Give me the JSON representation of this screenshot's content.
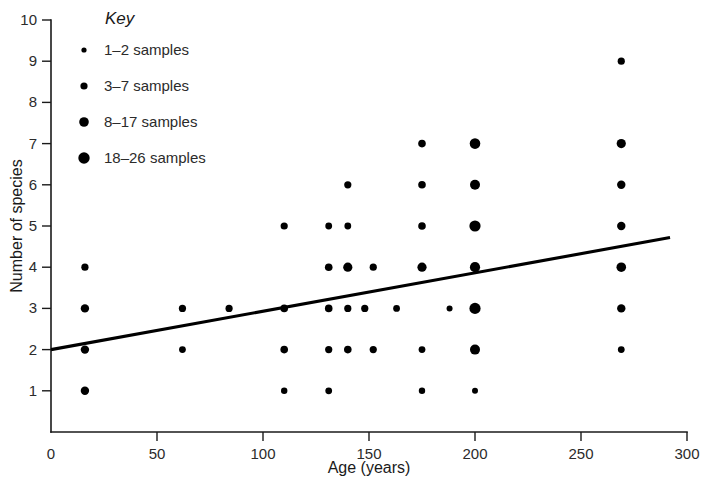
{
  "chart_data": {
    "type": "scatter",
    "title": "",
    "xlabel": "Age (years)",
    "ylabel": "Number of species",
    "xlim": [
      0,
      300
    ],
    "ylim": [
      0,
      10
    ],
    "xticks": [
      0,
      50,
      100,
      150,
      200,
      250,
      300
    ],
    "yticks": [
      1,
      2,
      3,
      4,
      5,
      6,
      7,
      8,
      9,
      10
    ],
    "grid": false,
    "legend_position": "top-left",
    "legend_title": "Key",
    "size_legend": [
      {
        "label": "1–2 samples",
        "radius": 2.6,
        "samples_min": 1,
        "samples_max": 2
      },
      {
        "label": "3–7 samples",
        "radius": 3.6,
        "samples_min": 3,
        "samples_max": 7
      },
      {
        "label": "8–17 samples",
        "radius": 4.8,
        "samples_min": 8,
        "samples_max": 17
      },
      {
        "label": "18–26 samples",
        "radius": 5.7,
        "samples_min": 18,
        "samples_max": 26
      }
    ],
    "points": [
      {
        "x": 16,
        "y": 4,
        "r": 3.6
      },
      {
        "x": 16,
        "y": 3,
        "r": 4.2
      },
      {
        "x": 16,
        "y": 2,
        "r": 4.2
      },
      {
        "x": 16,
        "y": 1,
        "r": 4.2
      },
      {
        "x": 62,
        "y": 3,
        "r": 3.6
      },
      {
        "x": 62,
        "y": 2,
        "r": 3.4
      },
      {
        "x": 84,
        "y": 3,
        "r": 3.6
      },
      {
        "x": 110,
        "y": 5,
        "r": 3.6
      },
      {
        "x": 110,
        "y": 3,
        "r": 3.8
      },
      {
        "x": 110,
        "y": 2,
        "r": 3.8
      },
      {
        "x": 110,
        "y": 1,
        "r": 3.2
      },
      {
        "x": 131,
        "y": 5,
        "r": 3.4
      },
      {
        "x": 131,
        "y": 4,
        "r": 3.8
      },
      {
        "x": 131,
        "y": 3,
        "r": 3.8
      },
      {
        "x": 131,
        "y": 2,
        "r": 3.6
      },
      {
        "x": 131,
        "y": 1,
        "r": 3.4
      },
      {
        "x": 140,
        "y": 6,
        "r": 3.6
      },
      {
        "x": 140,
        "y": 5,
        "r": 3.4
      },
      {
        "x": 140,
        "y": 4,
        "r": 4.6
      },
      {
        "x": 140,
        "y": 3,
        "r": 3.6
      },
      {
        "x": 140,
        "y": 2,
        "r": 3.8
      },
      {
        "x": 148,
        "y": 3,
        "r": 3.6
      },
      {
        "x": 152,
        "y": 4,
        "r": 3.6
      },
      {
        "x": 152,
        "y": 2,
        "r": 3.6
      },
      {
        "x": 163,
        "y": 3,
        "r": 3.4
      },
      {
        "x": 175,
        "y": 7,
        "r": 3.8
      },
      {
        "x": 175,
        "y": 6,
        "r": 3.8
      },
      {
        "x": 175,
        "y": 5,
        "r": 3.8
      },
      {
        "x": 175,
        "y": 4,
        "r": 4.6
      },
      {
        "x": 175,
        "y": 2,
        "r": 3.4
      },
      {
        "x": 175,
        "y": 1,
        "r": 3.2
      },
      {
        "x": 188,
        "y": 3,
        "r": 3.0
      },
      {
        "x": 200,
        "y": 7,
        "r": 5.3
      },
      {
        "x": 200,
        "y": 6,
        "r": 5.0
      },
      {
        "x": 200,
        "y": 5,
        "r": 5.6
      },
      {
        "x": 200,
        "y": 4,
        "r": 5.1
      },
      {
        "x": 200,
        "y": 3,
        "r": 5.6
      },
      {
        "x": 200,
        "y": 2,
        "r": 5.0
      },
      {
        "x": 200,
        "y": 1,
        "r": 3.0
      },
      {
        "x": 269,
        "y": 9,
        "r": 3.6
      },
      {
        "x": 269,
        "y": 7,
        "r": 4.6
      },
      {
        "x": 269,
        "y": 6,
        "r": 4.2
      },
      {
        "x": 269,
        "y": 5,
        "r": 4.2
      },
      {
        "x": 269,
        "y": 4,
        "r": 4.8
      },
      {
        "x": 269,
        "y": 3,
        "r": 4.2
      },
      {
        "x": 269,
        "y": 2,
        "r": 3.4
      }
    ],
    "trend_line": {
      "x_start": 0,
      "y_start": 2.0,
      "x_end": 292,
      "y_end": 4.72
    }
  }
}
